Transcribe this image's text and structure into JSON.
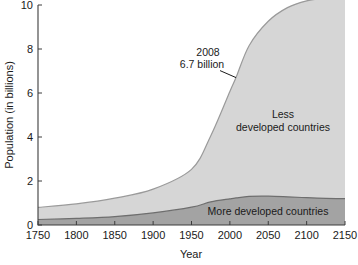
{
  "chart_data": {
    "type": "area",
    "title": "",
    "subtitle": "",
    "xlabel": "Year",
    "ylabel": "Population (in billions)",
    "xlim": [
      1750,
      2150
    ],
    "ylim": [
      0,
      10
    ],
    "grid": false,
    "legend_position": "inline-labels",
    "x_ticks": [
      1750,
      1800,
      1850,
      1900,
      1950,
      2000,
      2050,
      2100,
      2150
    ],
    "x_tick_labels": [
      "1750",
      "1800",
      "1850",
      "1900",
      "1950",
      "2000",
      "2050",
      "2100",
      "2150"
    ],
    "y_ticks": [
      0,
      2,
      4,
      6,
      8,
      10
    ],
    "y_tick_labels": [
      "0",
      "2",
      "4",
      "6",
      "8",
      "10"
    ],
    "x": [
      1750,
      1800,
      1850,
      1900,
      1950,
      1975,
      2000,
      2008,
      2025,
      2050,
      2075,
      2100,
      2125,
      2150
    ],
    "series": [
      {
        "name": "More developed countries",
        "label": "More developed countries",
        "color": "#a3a3a3",
        "edge_color": "#6e6e6e",
        "stacked": true,
        "values": [
          0.25,
          0.3,
          0.38,
          0.55,
          0.81,
          1.05,
          1.19,
          1.23,
          1.3,
          1.31,
          1.28,
          1.24,
          1.21,
          1.2
        ]
      },
      {
        "name": "Less developed countries",
        "label_line1": "Less",
        "label_line2": "developed countries",
        "label": "Less developed countries",
        "color": "#d6d6d6",
        "edge_color": "#9a9a9a",
        "stacked": true,
        "values": [
          0.55,
          0.66,
          0.84,
          1.08,
          1.72,
          3.0,
          4.88,
          5.47,
          6.85,
          7.95,
          8.6,
          8.95,
          9.1,
          9.2
        ]
      }
    ],
    "totals": [
      0.8,
      0.96,
      1.22,
      1.63,
      2.53,
      4.05,
      6.07,
      6.7,
      8.15,
      9.26,
      9.88,
      10.19,
      10.31,
      10.4
    ],
    "annotations": [
      {
        "name": "population-2008-callout",
        "line1": "2008",
        "line2": "6.7 billion",
        "x": 2008,
        "y": 6.7,
        "text_x": 2008,
        "text_y": 6.7
      }
    ]
  }
}
